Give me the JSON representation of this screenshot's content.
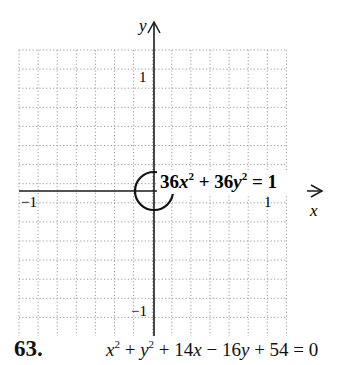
{
  "chart_data": {
    "type": "line",
    "title": "",
    "curve": {
      "kind": "circle",
      "equation_label": "36x² + 36y² = 1",
      "center": [
        0,
        0
      ],
      "radius": 0.1667
    },
    "xlabel": "x",
    "ylabel": "y",
    "xlim": [
      -1.2,
      1.2
    ],
    "ylim": [
      -1.2,
      1.2
    ],
    "grid": true,
    "grid_step": 0.1667,
    "x_ticks": [
      {
        "value": -1,
        "label": "−1"
      },
      {
        "value": 1,
        "label": "1"
      }
    ],
    "y_ticks": [
      {
        "value": 1,
        "label": "1"
      },
      {
        "value": -1,
        "label": "−1"
      }
    ],
    "legend": null
  },
  "problem": {
    "number": "63.",
    "equation_parts": [
      "x",
      "2",
      " + ",
      "y",
      "2",
      " + 14",
      "x",
      " − 16",
      "y",
      " + 54 = 0"
    ]
  },
  "colors": {
    "grid": "#9a9a9a",
    "axis": "#1a1a1a",
    "curve": "#111111"
  }
}
